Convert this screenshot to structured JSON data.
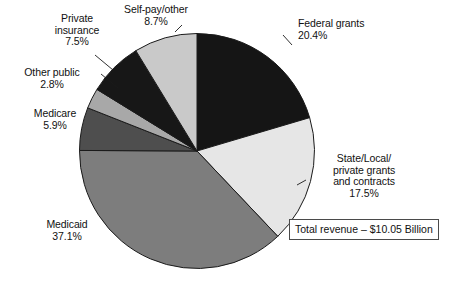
{
  "chart_data": {
    "type": "pie",
    "title": "",
    "subtitle": "",
    "xlabel": "",
    "ylabel": "",
    "legend_position": "none",
    "grid": false,
    "annotation": "Total revenue – $10.05 Billion",
    "start_angle_deg": 0,
    "direction": "clockwise",
    "categories": [
      "Federal grants",
      "State/Local/ private grants and contracts",
      "Medicaid",
      "Medicare",
      "Other public",
      "Private insurance",
      "Self-pay/other"
    ],
    "values": [
      20.4,
      17.5,
      37.1,
      5.9,
      2.8,
      7.5,
      8.7
    ],
    "value_unit": "%",
    "slices": [
      {
        "name": "Federal grants",
        "value": 20.4,
        "value_text": "20.4%",
        "label_lines": [
          "Federal grants",
          "20.4%"
        ],
        "color": "#151515",
        "leader": true
      },
      {
        "name": "State/Local/ private grants and contracts",
        "value": 17.5,
        "value_text": "17.5%",
        "label_lines": [
          "State/Local/",
          "private grants",
          "and contracts",
          "17.5%"
        ],
        "color": "#e6e6e6",
        "leader": true
      },
      {
        "name": "Medicaid",
        "value": 37.1,
        "value_text": "37.1%",
        "label_lines": [
          "Medicaid",
          "37.1%"
        ],
        "color": "#7d7d7d",
        "leader": false
      },
      {
        "name": "Medicare",
        "value": 5.9,
        "value_text": "5.9%",
        "label_lines": [
          "Medicare",
          "5.9%"
        ],
        "color": "#4e4e4e",
        "leader": false
      },
      {
        "name": "Other public",
        "value": 2.8,
        "value_text": "2.8%",
        "label_lines": [
          "Other public",
          "2.8%"
        ],
        "color": "#a8a8a8",
        "leader": true
      },
      {
        "name": "Private insurance",
        "value": 7.5,
        "value_text": "7.5%",
        "label_lines": [
          "Private",
          "insurance",
          "7.5%"
        ],
        "color": "#171717",
        "leader": true
      },
      {
        "name": "Self-pay/other",
        "value": 8.7,
        "value_text": "8.7%",
        "label_lines": [
          "Self-pay/other",
          "8.7%"
        ],
        "color": "#c9c9c9",
        "leader": true
      }
    ]
  },
  "labels": {
    "federal_grants": "Federal grants\n20.4%",
    "state_local": "State/Local/\nprivate grants\nand contracts\n17.5%",
    "medicaid": "Medicaid\n37.1%",
    "medicare": "Medicare\n5.9%",
    "other_public": "Other public\n2.8%",
    "private_insurance": "Private\ninsurance\n7.5%",
    "self_pay": "Self-pay/other\n8.7%"
  },
  "total_revenue": {
    "text": "Total revenue – $10.05 Billion"
  },
  "colors": {
    "outline": "#1a1a1a",
    "text": "#111111",
    "background": "#ffffff",
    "box_border": "#4a4a4a"
  }
}
